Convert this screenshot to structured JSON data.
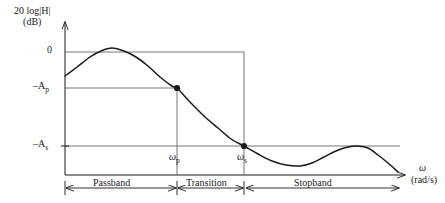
{
  "figure": {
    "kind": "filter-magnitude-response-specification",
    "background_color": "#ffffff",
    "line_color": "#1a1a1a",
    "guide_color": "#555555"
  },
  "axes": {
    "y_title_main": "20 log|H|",
    "y_title_unit": "(dB)",
    "x_symbol": "ω",
    "x_unit": "(rad/s)",
    "y_ticks": [
      {
        "name": "zero",
        "text": "0",
        "sub": ""
      },
      {
        "name": "minus-ap",
        "text": "–A",
        "sub": "p"
      },
      {
        "name": "minus-as",
        "text": "–A",
        "sub": "s"
      }
    ],
    "x_ticks": [
      {
        "name": "omega-p",
        "text": "ω",
        "sub": "p"
      },
      {
        "name": "omega-s",
        "text": "ω",
        "sub": "s"
      }
    ]
  },
  "bands": [
    {
      "name": "passband",
      "label": "Passband"
    },
    {
      "name": "transition",
      "label": "Transition"
    },
    {
      "name": "stopband",
      "label": "Stopband"
    }
  ],
  "chart_data": {
    "type": "line",
    "title": "",
    "xlabel": "ω (rad/s)",
    "ylabel": "20 log|H| (dB)",
    "grid": false,
    "legend": "none",
    "x_axis": {
      "origin_px": 65,
      "end_px": 400,
      "ticks": [
        {
          "label": "ωp",
          "px": 177
        },
        {
          "label": "ωs",
          "px": 244
        }
      ]
    },
    "y_axis": {
      "levels": [
        {
          "label": "0",
          "px": 52
        },
        {
          "label": "-Ap",
          "px": 88
        },
        {
          "label": "-As",
          "px": 146
        }
      ],
      "baseline_px": 175
    },
    "series": [
      {
        "name": "magnitude-response",
        "points_px": [
          [
            65,
            76
          ],
          [
            77,
            67
          ],
          [
            90,
            57
          ],
          [
            101,
            51
          ],
          [
            112,
            48
          ],
          [
            124,
            51
          ],
          [
            136,
            57
          ],
          [
            148,
            66
          ],
          [
            160,
            77
          ],
          [
            172,
            86
          ],
          [
            177,
            88
          ],
          [
            190,
            102
          ],
          [
            204,
            116
          ],
          [
            218,
            128
          ],
          [
            231,
            139
          ],
          [
            244,
            146
          ],
          [
            258,
            154
          ],
          [
            272,
            161
          ],
          [
            286,
            165
          ],
          [
            300,
            166
          ],
          [
            312,
            163
          ],
          [
            324,
            157
          ],
          [
            336,
            151
          ],
          [
            348,
            147
          ],
          [
            358,
            146
          ],
          [
            368,
            148
          ],
          [
            378,
            155
          ],
          [
            388,
            163
          ],
          [
            398,
            172
          ]
        ]
      }
    ],
    "markers": [
      {
        "name": "passband-edge-point",
        "x_px": 177,
        "y_px": 88
      },
      {
        "name": "stopband-edge-point",
        "x_px": 244,
        "y_px": 146
      }
    ],
    "guides": [
      {
        "name": "zero-level-line",
        "orientation": "horizontal",
        "y_px": 52,
        "x1_px": 65,
        "x2_px": 244
      },
      {
        "name": "minus-ap-level-line",
        "orientation": "horizontal",
        "y_px": 88,
        "x1_px": 65,
        "x2_px": 177
      },
      {
        "name": "minus-as-level-line",
        "orientation": "horizontal",
        "y_px": 146,
        "x1_px": 65,
        "x2_px": 400
      },
      {
        "name": "omega-p-drop-line",
        "orientation": "vertical",
        "x_px": 177,
        "y1_px": 88,
        "y2_px": 175
      },
      {
        "name": "omega-s-drop-line",
        "orientation": "vertical",
        "x_px": 244,
        "y1_px": 52,
        "y2_px": 175
      }
    ],
    "band_spans_px": [
      {
        "name": "passband",
        "x1": 65,
        "x2": 177
      },
      {
        "name": "transition",
        "x1": 177,
        "x2": 244
      },
      {
        "name": "stopband",
        "x1": 244,
        "x2": 400
      }
    ]
  }
}
